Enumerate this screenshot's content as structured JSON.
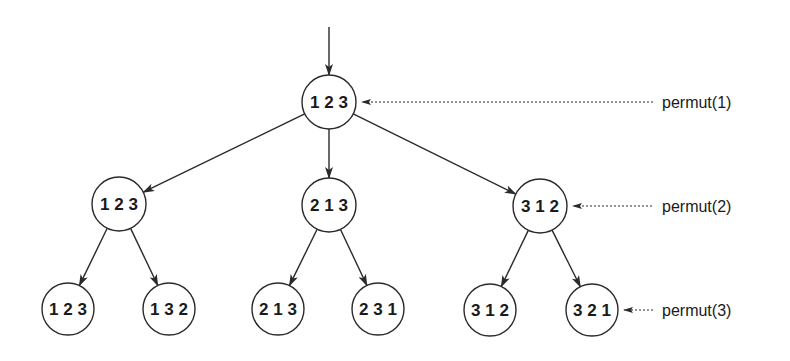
{
  "diagram": {
    "type": "recursion-tree",
    "title": "",
    "colors": {
      "stroke": "#2a2a2a",
      "text": "#1a1a1a",
      "background": "#ffffff"
    },
    "entry_arrow": {
      "from": [
        329,
        27
      ],
      "to": [
        329,
        75
      ]
    },
    "nodes": [
      {
        "id": "root",
        "label": "1 2 3",
        "cx": 329,
        "cy": 102,
        "r": 27,
        "level": 1
      },
      {
        "id": "l2a",
        "label": "1 2 3",
        "cx": 119,
        "cy": 204,
        "r": 27,
        "level": 2
      },
      {
        "id": "l2b",
        "label": "2 1 3",
        "cx": 329,
        "cy": 205,
        "r": 27,
        "level": 2
      },
      {
        "id": "l2c",
        "label": "3 1 2",
        "cx": 540,
        "cy": 206,
        "r": 27,
        "level": 2
      },
      {
        "id": "l3a",
        "label": "1 2 3",
        "cx": 68,
        "cy": 309,
        "r": 26,
        "level": 3
      },
      {
        "id": "l3b",
        "label": "1 3 2",
        "cx": 169,
        "cy": 309,
        "r": 26,
        "level": 3
      },
      {
        "id": "l3c",
        "label": "2 1 3",
        "cx": 278,
        "cy": 309,
        "r": 26,
        "level": 3
      },
      {
        "id": "l3d",
        "label": "2 3 1",
        "cx": 378,
        "cy": 309,
        "r": 26,
        "level": 3
      },
      {
        "id": "l3e",
        "label": "3 1 2",
        "cx": 490,
        "cy": 310,
        "r": 26,
        "level": 3
      },
      {
        "id": "l3f",
        "label": "3 2 1",
        "cx": 592,
        "cy": 310,
        "r": 26,
        "level": 3
      }
    ],
    "edges": [
      {
        "from": "root",
        "to": "l2a"
      },
      {
        "from": "root",
        "to": "l2b"
      },
      {
        "from": "root",
        "to": "l2c"
      },
      {
        "from": "l2a",
        "to": "l3a"
      },
      {
        "from": "l2a",
        "to": "l3b"
      },
      {
        "from": "l2b",
        "to": "l3c"
      },
      {
        "from": "l2b",
        "to": "l3d"
      },
      {
        "from": "l2c",
        "to": "l3e"
      },
      {
        "from": "l2c",
        "to": "l3f"
      }
    ],
    "level_labels": [
      {
        "text": "permut(1)",
        "target": "root",
        "x": 662,
        "y": 108,
        "line_from": 653
      },
      {
        "text": "permut(2)",
        "target": "l2c",
        "x": 662,
        "y": 212,
        "line_from": 652
      },
      {
        "text": "permut(3)",
        "target": "l3f",
        "x": 662,
        "y": 316,
        "line_from": 653
      }
    ]
  }
}
